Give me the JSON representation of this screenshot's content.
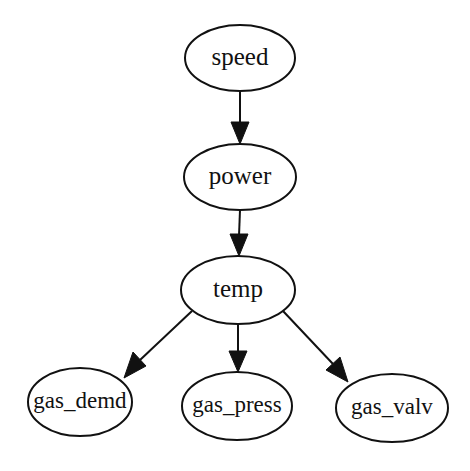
{
  "graph": {
    "type": "directed",
    "colors": {
      "stroke": "#111111",
      "fill": "#ffffff",
      "background": "#ffffff"
    },
    "nodes": [
      {
        "id": "speed",
        "label": "speed",
        "cx": 240,
        "cy": 58,
        "rx": 55,
        "ry": 33
      },
      {
        "id": "power",
        "label": "power",
        "cx": 240,
        "cy": 177,
        "rx": 56,
        "ry": 33
      },
      {
        "id": "temp",
        "label": "temp",
        "cx": 238,
        "cy": 290,
        "rx": 57,
        "ry": 34
      },
      {
        "id": "gas_demd",
        "label": "gas_demd",
        "cx": 80,
        "cy": 402,
        "rx": 52,
        "ry": 34
      },
      {
        "id": "gas_press",
        "label": "gas_press",
        "cx": 237,
        "cy": 406,
        "rx": 55,
        "ry": 34
      },
      {
        "id": "gas_valv",
        "label": "gas_valv",
        "cx": 392,
        "cy": 408,
        "rx": 56,
        "ry": 34
      }
    ],
    "edges": [
      {
        "from": "speed",
        "to": "power"
      },
      {
        "from": "power",
        "to": "temp"
      },
      {
        "from": "temp",
        "to": "gas_demd"
      },
      {
        "from": "temp",
        "to": "gas_press"
      },
      {
        "from": "temp",
        "to": "gas_valv"
      }
    ]
  }
}
